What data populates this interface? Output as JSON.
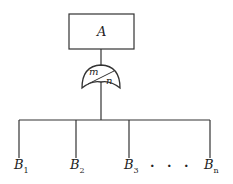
{
  "diagram": {
    "top_event": {
      "label": "A"
    },
    "gate": {
      "type": "voting-or-gate",
      "m_label": "m",
      "n_label": "n"
    },
    "inputs": [
      {
        "base": "B",
        "sub": "1"
      },
      {
        "base": "B",
        "sub": "2"
      },
      {
        "base": "B",
        "sub": "3"
      },
      {
        "base": "B",
        "sub": "n"
      }
    ],
    "ellipsis": ". . ."
  }
}
